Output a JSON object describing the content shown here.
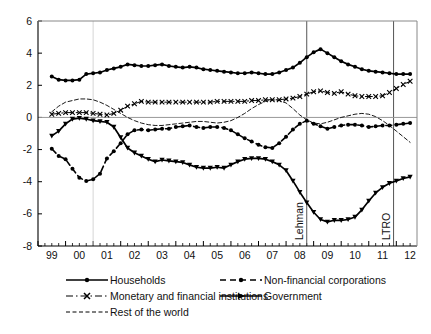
{
  "chart_data": {
    "type": "line",
    "title": "",
    "subtitle": "",
    "xlabel": "",
    "ylabel": "",
    "xlim": [
      1999.0,
      2012.75
    ],
    "ylim": [
      -8,
      6
    ],
    "yticks": [
      -8,
      -6,
      -4,
      -2,
      0,
      2,
      4,
      6
    ],
    "ytick_labels": [
      "-8",
      "-6",
      "-4",
      "-2",
      "0",
      "2",
      "4",
      "6"
    ],
    "xticks": [
      1999,
      2000,
      2001,
      2002,
      2003,
      2004,
      2005,
      2006,
      2007,
      2008,
      2009,
      2010,
      2011,
      2012
    ],
    "xtick_labels": [
      "99",
      "00",
      "01",
      "02",
      "03",
      "04",
      "05",
      "06",
      "07",
      "08",
      "09",
      "10",
      "11",
      "12"
    ],
    "minor_xticks_per_year": 4,
    "grid": false,
    "zero_line": true,
    "legend_position": "below",
    "annotations": [
      {
        "label": "Lehman",
        "x": 2008.75,
        "orientation": "vertical",
        "style": "solid-line"
      },
      {
        "label": "LTRO",
        "x": 2011.9,
        "orientation": "vertical",
        "style": "solid-line"
      },
      {
        "label": "",
        "x": 2001.0,
        "orientation": "vertical",
        "style": "light-line"
      }
    ],
    "x": [
      1999.5,
      1999.75,
      2000.0,
      2000.25,
      2000.5,
      2000.75,
      2001.0,
      2001.25,
      2001.5,
      2001.75,
      2002.0,
      2002.25,
      2002.5,
      2002.75,
      2003.0,
      2003.25,
      2003.5,
      2003.75,
      2004.0,
      2004.25,
      2004.5,
      2004.75,
      2005.0,
      2005.25,
      2005.5,
      2005.75,
      2006.0,
      2006.25,
      2006.5,
      2006.75,
      2007.0,
      2007.25,
      2007.5,
      2007.75,
      2008.0,
      2008.25,
      2008.5,
      2008.75,
      2009.0,
      2009.25,
      2009.5,
      2009.75,
      2010.0,
      2010.25,
      2010.5,
      2010.75,
      2011.0,
      2011.25,
      2011.5,
      2011.75,
      2012.0,
      2012.25,
      2012.5
    ],
    "series": [
      {
        "name": "Households",
        "marker": "filled-circle",
        "linestyle": "solid",
        "values": [
          2.55,
          2.35,
          2.3,
          2.3,
          2.35,
          2.7,
          2.75,
          2.8,
          2.95,
          3.05,
          3.15,
          3.3,
          3.25,
          3.2,
          3.2,
          3.25,
          3.3,
          3.2,
          3.15,
          3.1,
          3.15,
          3.1,
          3.0,
          2.95,
          2.9,
          2.85,
          2.8,
          2.75,
          2.75,
          2.8,
          2.75,
          2.7,
          2.7,
          2.8,
          2.95,
          3.1,
          3.4,
          3.75,
          4.05,
          4.25,
          4.0,
          3.75,
          3.5,
          3.3,
          3.15,
          3.0,
          2.9,
          2.85,
          2.8,
          2.75,
          2.7,
          2.7,
          2.7
        ]
      },
      {
        "name": "Non-financial corporations",
        "marker": "filled-circle",
        "linestyle": "dashed",
        "values": [
          -1.95,
          -2.4,
          -2.6,
          -3.2,
          -3.75,
          -3.95,
          -3.85,
          -3.5,
          -2.55,
          -2.1,
          -1.6,
          -1.05,
          -0.8,
          -0.75,
          -0.8,
          -0.75,
          -0.7,
          -0.7,
          -0.6,
          -0.55,
          -0.5,
          -0.6,
          -0.65,
          -0.6,
          -0.6,
          -0.65,
          -0.8,
          -1.05,
          -1.3,
          -1.5,
          -1.7,
          -1.85,
          -1.9,
          -1.6,
          -1.2,
          -0.75,
          -0.4,
          -0.2,
          -0.4,
          -0.55,
          -0.7,
          -0.6,
          -0.5,
          -0.45,
          -0.45,
          -0.5,
          -0.6,
          -0.55,
          -0.5,
          -0.5,
          -0.45,
          -0.4,
          -0.35
        ]
      },
      {
        "name": "Monetary and financial institutions",
        "marker": "x-cross",
        "linestyle": "dash-dot",
        "values": [
          0.2,
          0.25,
          0.3,
          0.3,
          0.3,
          0.3,
          0.25,
          0.2,
          0.15,
          0.25,
          0.45,
          0.7,
          0.85,
          1.0,
          0.95,
          0.95,
          0.95,
          0.95,
          0.95,
          0.95,
          0.95,
          0.95,
          0.95,
          0.95,
          1.0,
          1.0,
          1.0,
          1.0,
          1.0,
          1.05,
          1.05,
          1.1,
          1.1,
          1.1,
          1.15,
          1.2,
          1.3,
          1.45,
          1.6,
          1.65,
          1.55,
          1.5,
          1.6,
          1.45,
          1.35,
          1.3,
          1.3,
          1.3,
          1.35,
          1.55,
          1.8,
          2.05,
          2.25
        ]
      },
      {
        "name": "Government",
        "marker": "filled-triangle",
        "linestyle": "solid",
        "values": [
          -1.15,
          -0.85,
          -0.4,
          -0.1,
          -0.05,
          -0.1,
          -0.2,
          -0.25,
          -0.3,
          -0.6,
          -1.25,
          -1.9,
          -2.2,
          -2.4,
          -2.6,
          -2.75,
          -2.65,
          -2.7,
          -2.75,
          -2.8,
          -2.95,
          -3.1,
          -3.15,
          -3.15,
          -3.1,
          -3.15,
          -2.95,
          -2.75,
          -2.6,
          -2.55,
          -2.55,
          -2.6,
          -2.75,
          -2.95,
          -3.3,
          -3.95,
          -4.65,
          -5.3,
          -5.9,
          -6.35,
          -6.5,
          -6.4,
          -6.4,
          -6.35,
          -6.2,
          -5.75,
          -5.2,
          -4.7,
          -4.35,
          -4.1,
          -3.95,
          -3.8,
          -3.7
        ]
      },
      {
        "name": "Rest of the world",
        "marker": "none",
        "linestyle": "fine-dashed",
        "values": [
          0.35,
          0.7,
          0.95,
          1.05,
          1.15,
          1.15,
          1.1,
          0.95,
          0.75,
          0.5,
          0.25,
          0.0,
          -0.2,
          -0.35,
          -0.45,
          -0.5,
          -0.5,
          -0.45,
          -0.4,
          -0.35,
          -0.3,
          -0.25,
          -0.25,
          -0.3,
          -0.35,
          -0.3,
          -0.2,
          0.0,
          0.25,
          0.55,
          0.8,
          1.0,
          1.1,
          1.05,
          0.9,
          0.55,
          0.15,
          -0.15,
          -0.35,
          -0.4,
          -0.3,
          -0.15,
          0.0,
          0.1,
          0.2,
          0.25,
          0.2,
          0.05,
          -0.2,
          -0.5,
          -0.85,
          -1.2,
          -1.55
        ]
      }
    ]
  },
  "legend": {
    "items": [
      {
        "label": "Households",
        "symbol": "solid-circle-line"
      },
      {
        "label": "Non-financial corporations",
        "symbol": "dashed-circle-line"
      },
      {
        "label": "Monetary and financial institutions",
        "symbol": "dashdot-cross-line"
      },
      {
        "label": "Government",
        "symbol": "solid-triangle-line"
      },
      {
        "label": "Rest of the world",
        "symbol": "fine-dashed-line"
      }
    ]
  },
  "colors": {
    "line": "#000000",
    "axis": "#000000",
    "zero_line": "#999999",
    "marker_line": "#b0b0b0",
    "background": "#ffffff"
  }
}
